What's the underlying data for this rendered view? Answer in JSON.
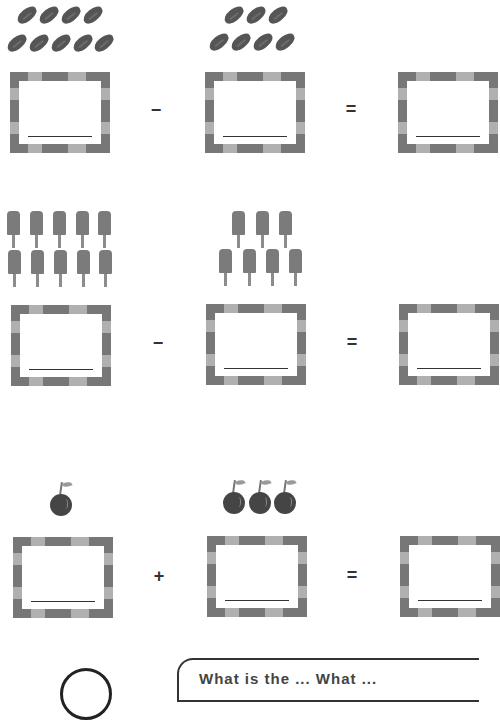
{
  "worksheet": {
    "rows": [
      {
        "object": "bean",
        "left_count": 9,
        "left_layout": [
          4,
          5
        ],
        "operator": "−",
        "right_count": 7,
        "right_layout": [
          3,
          4
        ],
        "equals": "=",
        "answers": [
          "",
          "",
          ""
        ]
      },
      {
        "object": "popsicle",
        "left_count": 10,
        "left_layout": [
          5,
          5
        ],
        "operator": "−",
        "right_count": 7,
        "right_layout": [
          3,
          4
        ],
        "equals": "=",
        "answers": [
          "",
          "",
          ""
        ]
      },
      {
        "object": "cherry",
        "left_count": 1,
        "left_layout": [
          1
        ],
        "operator": "+",
        "right_count": 3,
        "right_layout": [
          3
        ],
        "equals": "=",
        "answers": [
          "",
          "",
          ""
        ]
      }
    ],
    "footer": {
      "bubble_text": "What is the ... What ..."
    }
  },
  "colors": {
    "object_dark": "#555555",
    "frame_dark": "#777777",
    "frame_light": "#b0b0b0",
    "line": "#333333"
  }
}
